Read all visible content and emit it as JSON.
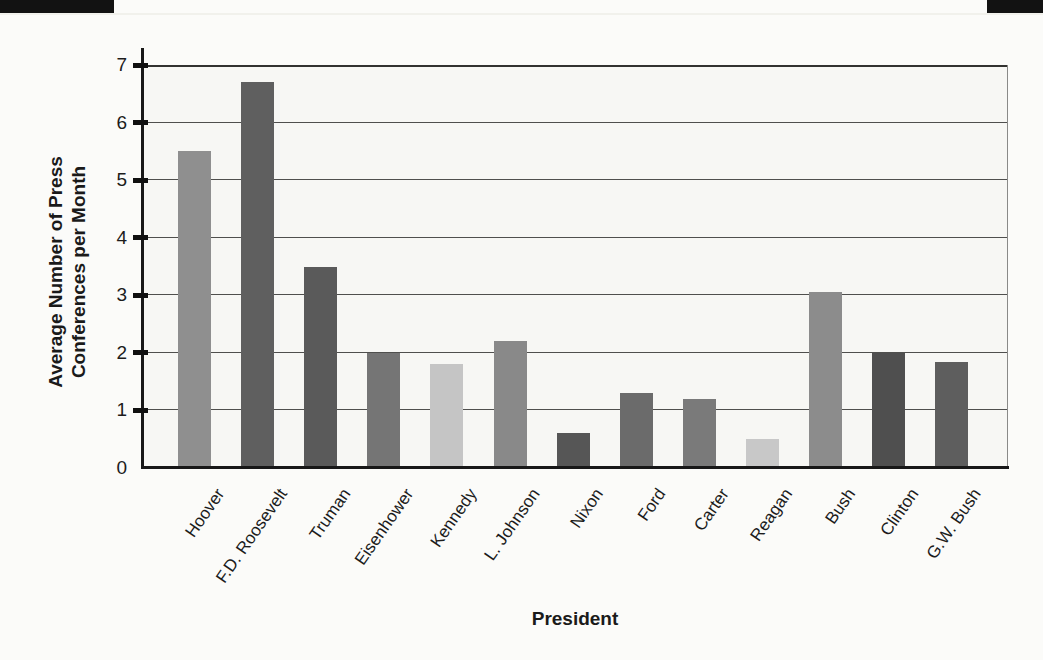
{
  "page": {
    "background_color": "#fbfbf9",
    "scan_marks": [
      "top-left-black-bar",
      "top-right-black-bar"
    ],
    "scan_mark_color": "#121212"
  },
  "chart_data": {
    "type": "bar",
    "title": "",
    "xlabel": "President",
    "ylabel": "Average Number of Press Conferences per Month",
    "ylabel_lines": [
      "Average Number of Press",
      "Conferences per Month"
    ],
    "categories": [
      "Hoover",
      "F.D. Roosevelt",
      "Truman",
      "Eisenhower",
      "Kennedy",
      "L. Johnson",
      "Nixon",
      "Ford",
      "Carter",
      "Reagan",
      "Bush",
      "Clinton",
      "G.W. Bush"
    ],
    "values": [
      5.5,
      6.7,
      3.5,
      2.0,
      1.8,
      2.2,
      0.6,
      1.3,
      1.2,
      0.5,
      3.05,
      2.0,
      1.85
    ],
    "bar_colors": [
      "#8f8f8f",
      "#5f5f5f",
      "#5a5a5a",
      "#757575",
      "#c5c5c5",
      "#898989",
      "#565656",
      "#6b6b6b",
      "#7a7a7a",
      "#c8c8c8",
      "#8c8c8c",
      "#4f4f4f",
      "#5e5e5e"
    ],
    "ylim": [
      0,
      7
    ],
    "yticks": [
      0,
      1,
      2,
      3,
      4,
      5,
      6,
      7
    ],
    "grid": "horizontal gridlines at each integer 1-7",
    "legend": "none",
    "axis_color": "#181818",
    "gridline_color": "#4f4f4d",
    "plot_background": "#f7f7f4"
  }
}
